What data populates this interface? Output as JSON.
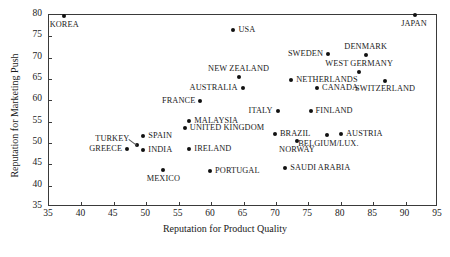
{
  "chart_data": {
    "type": "scatter",
    "title": "",
    "xlabel": "Reputation for Product Quality",
    "ylabel": "Reputation for Marketing Push",
    "xlim": [
      35,
      95
    ],
    "ylim": [
      35,
      80
    ],
    "xticks": [
      35,
      40,
      45,
      50,
      55,
      60,
      65,
      70,
      75,
      80,
      85,
      90,
      95
    ],
    "yticks": [
      35,
      40,
      45,
      50,
      55,
      60,
      65,
      70,
      75,
      80
    ],
    "grid": false,
    "legend": "none",
    "points": [
      {
        "label": "KOREA",
        "x": 37.5,
        "y": 79.5,
        "lp": "c",
        "lx": 0,
        "ly": 9
      },
      {
        "label": "JAPAN",
        "x": 91.6,
        "y": 79.8,
        "lp": "c",
        "lx": -1,
        "ly": 9
      },
      {
        "label": "USA",
        "x": 63.6,
        "y": 76.3,
        "lp": "r",
        "lx": 5,
        "ly": 0
      },
      {
        "label": "SWEDEN",
        "x": 78.2,
        "y": 70.7,
        "lp": "l",
        "lx": -5,
        "ly": 0
      },
      {
        "label": "DENMARK",
        "x": 84.0,
        "y": 70.3,
        "lp": "c",
        "lx": 0,
        "ly": -8
      },
      {
        "label": "WEST GERMANY",
        "x": 83.0,
        "y": 66.3,
        "lp": "c",
        "lx": 0,
        "ly": -8
      },
      {
        "label": "NEW ZEALAND",
        "x": 64.4,
        "y": 65.3,
        "lp": "c",
        "lx": 0,
        "ly": -8
      },
      {
        "label": "NETHERLANDS",
        "x": 72.5,
        "y": 64.5,
        "lp": "r",
        "lx": 5,
        "ly": 0
      },
      {
        "label": "SWITZERLAND",
        "x": 87.0,
        "y": 64.3,
        "lp": "c",
        "lx": 0,
        "ly": 8
      },
      {
        "label": "AUSTRALIA",
        "x": 65.0,
        "y": 62.7,
        "lp": "l",
        "lx": -5,
        "ly": 0
      },
      {
        "label": "CANADA",
        "x": 76.5,
        "y": 62.7,
        "lp": "r",
        "lx": 5,
        "ly": 0
      },
      {
        "label": "FRANCE",
        "x": 58.5,
        "y": 59.5,
        "lp": "l",
        "lx": -5,
        "ly": 0
      },
      {
        "label": "FINLAND",
        "x": 75.5,
        "y": 57.2,
        "lp": "r",
        "lx": 5,
        "ly": 0
      },
      {
        "label": "ITALY",
        "x": 70.4,
        "y": 57.2,
        "lp": "l",
        "lx": -5,
        "ly": 0
      },
      {
        "label": "MALAYSIA",
        "x": 56.8,
        "y": 55.0,
        "lp": "r",
        "lx": 5,
        "ly": 0
      },
      {
        "label": "UNITED KINGDOM",
        "x": 56.1,
        "y": 53.3,
        "lp": "r",
        "lx": 5,
        "ly": 0
      },
      {
        "label": "BRAZIL",
        "x": 70.0,
        "y": 51.8,
        "lp": "r",
        "lx": 5,
        "ly": 0
      },
      {
        "label": "AUSTRIA",
        "x": 80.2,
        "y": 51.8,
        "lp": "r",
        "lx": 5,
        "ly": 0
      },
      {
        "label": "BELGIUM/LUX.",
        "x": 78.1,
        "y": 51.6,
        "lp": "c",
        "lx": 1,
        "ly": 9
      },
      {
        "label": "SPAIN",
        "x": 49.7,
        "y": 51.3,
        "lp": "r",
        "lx": 5,
        "ly": 0
      },
      {
        "label": "NORWAY",
        "x": 73.4,
        "y": 50.2,
        "lp": "c",
        "lx": 0,
        "ly": 9
      },
      {
        "label": "TURKEY",
        "x": 48.8,
        "y": 49.2,
        "lp": "lead",
        "lx": -8,
        "ly": -6
      },
      {
        "label": "GREECE",
        "x": 47.2,
        "y": 48.4,
        "lp": "l",
        "lx": -5,
        "ly": 0
      },
      {
        "label": "INDIA",
        "x": 49.7,
        "y": 48.2,
        "lp": "r",
        "lx": 5,
        "ly": 0
      },
      {
        "label": "IRELAND",
        "x": 56.8,
        "y": 48.3,
        "lp": "r",
        "lx": 5,
        "ly": 0
      },
      {
        "label": "SAUDI ARABIA",
        "x": 71.6,
        "y": 44.0,
        "lp": "r",
        "lx": 5,
        "ly": 0
      },
      {
        "label": "MEXICO",
        "x": 52.8,
        "y": 43.4,
        "lp": "c",
        "lx": 0,
        "ly": 9
      },
      {
        "label": "PORTUGAL",
        "x": 60.0,
        "y": 43.1,
        "lp": "r",
        "lx": 5,
        "ly": 0
      }
    ],
    "marker": {
      "shape": "circle",
      "color": "#111111",
      "size": 4
    },
    "axis_color": "#3a3a3a"
  }
}
